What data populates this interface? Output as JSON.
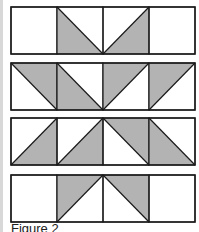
{
  "figure": {
    "caption": "Figure 2",
    "colors": {
      "shade": "#b3b3b3",
      "line": "#1a1a1a",
      "background": "#ffffff"
    },
    "grid": {
      "columns": 4,
      "left": 11,
      "right": 195
    },
    "rows": [
      {
        "top": 7,
        "bottom": 54,
        "cells": [
          "blank",
          "bl-shaded-tl-br",
          "br-shaded-bl-tr",
          "blank"
        ]
      },
      {
        "top": 63,
        "bottom": 110,
        "cells": [
          "tr-shaded-tl-br",
          "bl-shaded-tl-br",
          "tl-shaded-bl-tr",
          "tl-shaded-bl-tr"
        ]
      },
      {
        "top": 118,
        "bottom": 165,
        "cells": [
          "br-shaded-bl-tr",
          "br-shaded-bl-tr",
          "tr-shaded-tl-br",
          "bl-shaded-tl-br"
        ]
      },
      {
        "top": 175,
        "bottom": 222,
        "cells": [
          "blank",
          "tl-shaded-bl-tr",
          "tr-shaded-tl-br",
          "blank"
        ]
      }
    ]
  }
}
